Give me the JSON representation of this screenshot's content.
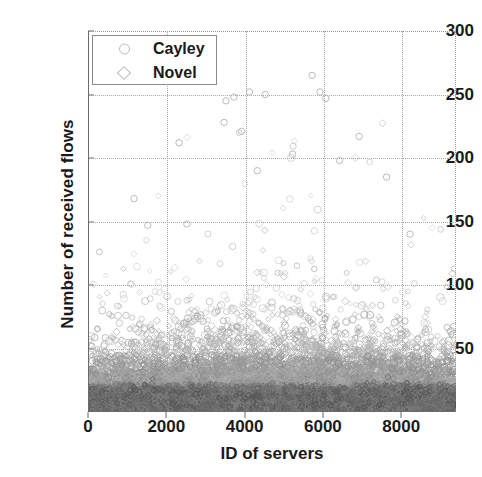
{
  "chart_data": {
    "type": "scatter",
    "title": "",
    "xlabel": "ID of servers",
    "ylabel": "Number of received flows",
    "xlim": [
      0,
      9400
    ],
    "ylim": [
      0,
      300
    ],
    "xticks": [
      0,
      2000,
      4000,
      6000,
      8000
    ],
    "xticklabels": [
      "0",
      "2000",
      "4000",
      "6000",
      "8000"
    ],
    "yticks": [
      50,
      100,
      150,
      200,
      250,
      300
    ],
    "yticklabels": [
      "50",
      "100",
      "150",
      "200",
      "250",
      "300"
    ],
    "grid": true,
    "grid_style": "dotted",
    "legend_position": "upper-left",
    "series": [
      {
        "name": "Cayley",
        "marker": "circle",
        "color": "#8c8c8c",
        "description": "Dense band of points from ID 0 to 9400; bulk of values below 40 flows, thinning out between 40 and 100, with scattered outliers up to 265."
      },
      {
        "name": "Novel",
        "marker": "diamond",
        "color": "#9a9a9a",
        "description": "Overlaps the Cayley cloud across the same ID range; concentrated below 40 flows with sparse points reaching about 110."
      }
    ],
    "density_profile": {
      "note": "Point density as a function of flow count (shared by both series)",
      "bins": [
        {
          "range": [
            0,
            20
          ],
          "density": "saturated"
        },
        {
          "range": [
            20,
            40
          ],
          "density": "very-high"
        },
        {
          "range": [
            40,
            60
          ],
          "density": "high"
        },
        {
          "range": [
            60,
            90
          ],
          "density": "moderate"
        },
        {
          "range": [
            90,
            130
          ],
          "density": "sparse"
        },
        {
          "range": [
            130,
            200
          ],
          "density": "very-sparse"
        },
        {
          "range": [
            200,
            270
          ],
          "density": "isolated outliers"
        }
      ]
    },
    "outliers": [
      {
        "x": 1150,
        "y": 168
      },
      {
        "x": 1500,
        "y": 147
      },
      {
        "x": 2300,
        "y": 212
      },
      {
        "x": 2500,
        "y": 148
      },
      {
        "x": 3450,
        "y": 228
      },
      {
        "x": 3500,
        "y": 245
      },
      {
        "x": 3700,
        "y": 248
      },
      {
        "x": 3900,
        "y": 221
      },
      {
        "x": 4100,
        "y": 252
      },
      {
        "x": 4300,
        "y": 190
      },
      {
        "x": 4500,
        "y": 250
      },
      {
        "x": 5200,
        "y": 203
      },
      {
        "x": 5700,
        "y": 265
      },
      {
        "x": 5900,
        "y": 252
      },
      {
        "x": 6050,
        "y": 247
      },
      {
        "x": 6400,
        "y": 198
      },
      {
        "x": 6900,
        "y": 217
      },
      {
        "x": 7600,
        "y": 185
      },
      {
        "x": 8200,
        "y": 140
      }
    ]
  },
  "legend": {
    "entries": [
      {
        "label": "Cayley",
        "marker": "circle"
      },
      {
        "label": "Novel",
        "marker": "diamond"
      }
    ]
  },
  "axes": {
    "ylabel": "Number of received flows",
    "xlabel": "ID of servers"
  }
}
